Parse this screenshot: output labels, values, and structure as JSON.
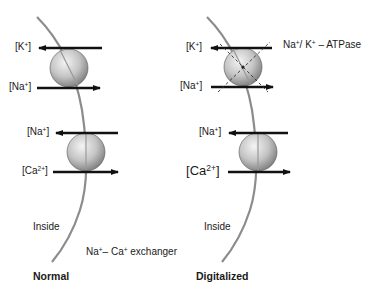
{
  "panels": {
    "normal": {
      "title": "Normal",
      "inside_label": "Inside",
      "pump1": {
        "top_ion": "K",
        "top_charge": "+",
        "bottom_ion": "Na",
        "bottom_charge": "+"
      },
      "pump2": {
        "top_ion": "Na",
        "top_charge": "+",
        "bottom_ion": "Ca",
        "bottom_charge": "2+"
      },
      "exchanger_label": {
        "a": "Na",
        "a_sup": "+",
        "dash": "– ",
        "b": "Ca",
        "b_sup": "+",
        "rest": " exchanger"
      }
    },
    "digitalized": {
      "title": "Digitalized",
      "inside_label": "Inside",
      "pump1": {
        "top_ion": "K",
        "top_charge": "+",
        "bottom_ion": "Na",
        "bottom_charge": "+",
        "inhibited": true
      },
      "pump2": {
        "top_ion": "Na",
        "top_charge": "+",
        "bottom_ion": "Ca",
        "bottom_charge": "2+"
      },
      "atpase_label": {
        "a": "Na",
        "a_sup": "+",
        "slash": "/ ",
        "b": "K",
        "b_sup": "+",
        "rest": " – ATPase"
      }
    }
  },
  "colors": {
    "membrane": "#8c8c8c",
    "arrow": "#111111",
    "sphere_light": "#f2f2f2",
    "sphere_dark": "#7a7a7a",
    "text": "#1a1a1a"
  }
}
